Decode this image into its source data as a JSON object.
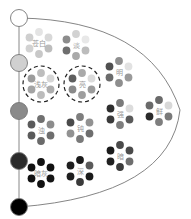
{
  "diagram": {
    "axis": {
      "steps": [
        {
          "name": "white",
          "y": 18,
          "color": "#ffffff"
        },
        {
          "name": "light-gray",
          "y": 63,
          "color": "#d0d0d0"
        },
        {
          "name": "mid-gray",
          "y": 111,
          "color": "#8a8a8a"
        },
        {
          "name": "dark-gray",
          "y": 161,
          "color": "#2a2a2a"
        },
        {
          "name": "black",
          "y": 207,
          "color": "#000000"
        }
      ]
    },
    "tones": [
      {
        "label": "苍白",
        "cx": 39,
        "cy": 43,
        "dashed": false,
        "colors": [
          "#e4e4e4",
          "#d8d8d8",
          "#bdbdbd",
          "#c8c8c8",
          "#d2d2d2",
          "#cfcfcf"
        ]
      },
      {
        "label": "淡",
        "cx": 76,
        "cy": 45,
        "dashed": false,
        "colors": [
          "#d2d2d2",
          "#e8e8e8",
          "#bcbcbc",
          "#a9a9a9",
          "#6e6e6e",
          "#8c8c8c"
        ]
      },
      {
        "label": "明",
        "cx": 119,
        "cy": 72,
        "dashed": false,
        "colors": [
          "#8f8f8f",
          "#e2e2e2",
          "#9a9a9a",
          "#8e8e8e",
          "#6b6b6b",
          "#505050"
        ]
      },
      {
        "label": "浅灰",
        "cx": 41,
        "cy": 84,
        "dashed": true,
        "colors": [
          "#bdbdbd",
          "#d6d6d6",
          "#adadad",
          "#bcbcbc",
          "#a4a4a4",
          "#9c9c9c"
        ]
      },
      {
        "label": "亮",
        "cx": 82,
        "cy": 84,
        "dashed": true,
        "colors": [
          "#a9a9a9",
          "#dcdcdc",
          "#9c9c9c",
          "#9e9e9e",
          "#8a8a8a",
          "#5e5e5e"
        ]
      },
      {
        "label": "强",
        "cx": 120,
        "cy": 114,
        "dashed": false,
        "colors": [
          "#7a7a7a",
          "#dcdcdc",
          "#5a5a5a",
          "#7e7e7e",
          "#3a3a3a",
          "#2e2e2e"
        ]
      },
      {
        "label": "鲜",
        "cx": 159,
        "cy": 111,
        "dashed": false,
        "colors": [
          "#6a6a6a",
          "#d8d8d8",
          "#7a7a7a",
          "#7e7e7e",
          "#2a2a2a",
          "#6a6a6a"
        ]
      },
      {
        "label": "浊",
        "cx": 41,
        "cy": 130,
        "dashed": false,
        "colors": [
          "#707070",
          "#8c8c8c",
          "#6e6e6e",
          "#6a6a6a",
          "#5a5a5a",
          "#5a5a5a"
        ]
      },
      {
        "label": "钝",
        "cx": 80,
        "cy": 128,
        "dashed": false,
        "colors": [
          "#7e7e7e",
          "#929292",
          "#6e6e6e",
          "#7a7a7a",
          "#929292",
          "#4a4a4a"
        ]
      },
      {
        "label": "暗",
        "cx": 120,
        "cy": 156,
        "dashed": false,
        "colors": [
          "#4a4a4a",
          "#4a4a4a",
          "#6e6e6e",
          "#3a3a3a",
          "#202020",
          "#1a1a1a"
        ]
      },
      {
        "label": "暗灰",
        "cx": 41,
        "cy": 173,
        "dashed": false,
        "colors": [
          "#111111",
          "#111111",
          "#151515",
          "#111111",
          "#111111",
          "#111111"
        ]
      },
      {
        "label": "深",
        "cx": 80,
        "cy": 171,
        "dashed": false,
        "colors": [
          "#1a1a1a",
          "#5a5a5a",
          "#1a1a1a",
          "#3a3a3a",
          "#1e1e1e",
          "#1e1e1e"
        ]
      }
    ]
  }
}
